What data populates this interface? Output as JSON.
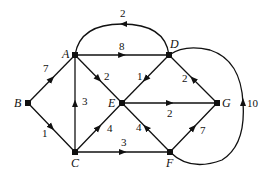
{
  "diagram": {
    "type": "directed-weighted-graph",
    "nodes": [
      {
        "id": "A",
        "label": "A",
        "x": 75,
        "y": 55,
        "lx": 62,
        "ly": 58
      },
      {
        "id": "B",
        "label": "B",
        "x": 28,
        "y": 103,
        "lx": 14,
        "ly": 107
      },
      {
        "id": "C",
        "label": "C",
        "x": 75,
        "y": 152,
        "lx": 71,
        "ly": 167
      },
      {
        "id": "D",
        "label": "D",
        "x": 169,
        "y": 55,
        "lx": 170,
        "ly": 48
      },
      {
        "id": "E",
        "label": "E",
        "x": 122,
        "y": 103,
        "lx": 108,
        "ly": 107
      },
      {
        "id": "F",
        "label": "F",
        "x": 170,
        "y": 152,
        "lx": 166,
        "ly": 167
      },
      {
        "id": "G",
        "label": "G",
        "x": 217,
        "y": 103,
        "lx": 222,
        "ly": 107
      }
    ],
    "edges": [
      {
        "from": "B",
        "to": "A",
        "weight": "7",
        "wx": 43,
        "wy": 72
      },
      {
        "from": "B",
        "to": "C",
        "weight": "1",
        "wx": 42,
        "wy": 137
      },
      {
        "from": "A",
        "to": "D",
        "weight": "8",
        "wx": 120,
        "wy": 50
      },
      {
        "from": "D",
        "to": "A",
        "weight": "2",
        "wx": 121,
        "wy": 17,
        "curved": true
      },
      {
        "from": "A",
        "to": "E",
        "weight": "2",
        "wx": 104,
        "wy": 80
      },
      {
        "from": "C",
        "to": "A",
        "weight": "3",
        "wx": 83,
        "wy": 105
      },
      {
        "from": "C",
        "to": "E",
        "weight": "4",
        "wx": 106,
        "wy": 132
      },
      {
        "from": "C",
        "to": "F",
        "weight": "3",
        "wx": 122,
        "wy": 146
      },
      {
        "from": "D",
        "to": "E",
        "weight": "1",
        "wx": 137,
        "wy": 80
      },
      {
        "from": "G",
        "to": "D",
        "weight": "2",
        "wx": 183,
        "wy": 82
      },
      {
        "from": "E",
        "to": "G",
        "weight": "2",
        "wx": 168,
        "wy": 116
      },
      {
        "from": "F",
        "to": "E",
        "weight": "4",
        "wx": 134,
        "wy": 131
      },
      {
        "from": "F",
        "to": "G",
        "weight": "7",
        "wx": 199,
        "wy": 134
      },
      {
        "from": "F",
        "to": "D",
        "weight": "10",
        "wx": 247,
        "wy": 107,
        "curved": true
      }
    ]
  }
}
